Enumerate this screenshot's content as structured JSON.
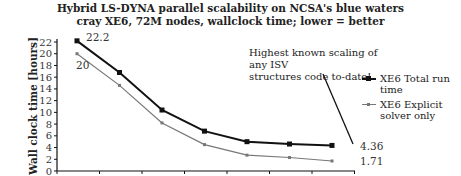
{
  "chart_data": {
    "type": "line",
    "title": "Hybrid LS-DYNA parallel scalability on NCSA's blue waters cray XE6, 72M nodes, wallclock time; lower = better",
    "title_lines": [
      "Hybrid LS-DYNA parallel scalability on NCSA's blue waters",
      "cray XE6, 72M nodes, wallclock time; lower = better"
    ],
    "xlabel": "",
    "ylabel": "Wall clock time [hours]",
    "ylim": [
      0,
      22
    ],
    "yticks": [
      0,
      2,
      4,
      6,
      8,
      10,
      12,
      14,
      16,
      18,
      20,
      22
    ],
    "x": [
      1,
      2,
      3,
      4,
      5,
      6,
      7
    ],
    "series": [
      {
        "name": "XE6 Total run time",
        "values": [
          22.2,
          16.8,
          10.4,
          6.8,
          5.0,
          4.6,
          4.36
        ],
        "color": "#111111",
        "marker": "square"
      },
      {
        "name": "XE6 Explicit solver only",
        "values": [
          20,
          14.6,
          8.2,
          4.5,
          2.7,
          2.3,
          1.71
        ],
        "color": "#777777",
        "marker": "small-square"
      }
    ],
    "data_labels": [
      {
        "series": 0,
        "index": 0,
        "text": "22.2"
      },
      {
        "series": 1,
        "index": 0,
        "text": "20"
      },
      {
        "series": 0,
        "index": 6,
        "text": "4.36"
      },
      {
        "series": 1,
        "index": 6,
        "text": "1.71"
      }
    ],
    "annotation": "Highest known scaling of any ISV structures code to-date!",
    "grid": false,
    "legend_position": "right"
  },
  "title": {
    "line1": "Hybrid LS-DYNA parallel scalability on NCSA's blue waters",
    "line2": "cray XE6, 72M nodes, wallclock time; lower = better"
  },
  "annotation": {
    "line1": "Highest known scaling of any ISV",
    "line2": "structures code to-date!"
  },
  "legend": {
    "items": [
      {
        "line1": "XE6 Total run",
        "line2": "time"
      },
      {
        "line1": "XE6 Explicit",
        "line2": "solver only"
      }
    ]
  },
  "labels": {
    "ylabel": "Wall clock time [hours]",
    "total_first": "22.2",
    "explicit_first": "20",
    "total_last": "4.36",
    "explicit_last": "1.71"
  }
}
